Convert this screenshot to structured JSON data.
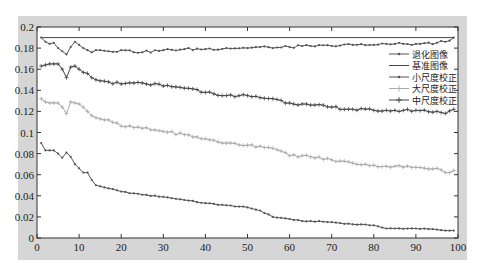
{
  "chart_data": {
    "type": "line",
    "title": "",
    "xlabel": "",
    "ylabel": "",
    "xlim": [
      0,
      100
    ],
    "ylim": [
      0,
      0.2
    ],
    "grid": false,
    "legend_position": "upper right (inside)",
    "x_ticks": [
      "0",
      "10",
      "20",
      "30",
      "40",
      "50",
      "60",
      "70",
      "80",
      "90",
      "100"
    ],
    "y_ticks": [
      "0",
      "0.02",
      "0.04",
      "0.06",
      "0.08",
      "0.1",
      "0.12",
      "0.14",
      "0.16",
      "0.18",
      "0.2"
    ],
    "x_anchor": [
      1,
      2,
      3,
      4,
      5,
      6,
      7,
      8,
      9,
      10,
      11,
      12,
      13,
      14,
      15,
      17,
      20,
      25,
      30,
      35,
      40,
      45,
      50,
      53,
      56,
      60,
      63,
      65,
      70,
      75,
      80,
      83,
      85,
      90,
      95,
      97,
      99
    ],
    "series": [
      {
        "name": "退化图像",
        "color": "#555555",
        "marker": "dot",
        "values": [
          0.09,
          0.083,
          0.083,
          0.083,
          0.08,
          0.076,
          0.081,
          0.077,
          0.07,
          0.066,
          0.062,
          0.062,
          0.055,
          0.05,
          0.049,
          0.047,
          0.044,
          0.041,
          0.039,
          0.036,
          0.033,
          0.031,
          0.029,
          0.026,
          0.02,
          0.018,
          0.016,
          0.016,
          0.015,
          0.013,
          0.012,
          0.009,
          0.009,
          0.009,
          0.008,
          0.007,
          0.007
        ]
      },
      {
        "name": "基准图像",
        "color": "#444444",
        "marker": "none",
        "values": [
          0.19,
          0.19,
          0.19,
          0.19,
          0.19,
          0.19,
          0.19,
          0.19,
          0.19,
          0.19,
          0.19,
          0.19,
          0.19,
          0.19,
          0.19,
          0.19,
          0.19,
          0.19,
          0.19,
          0.19,
          0.19,
          0.19,
          0.19,
          0.19,
          0.19,
          0.19,
          0.19,
          0.19,
          0.19,
          0.19,
          0.19,
          0.19,
          0.19,
          0.19,
          0.19,
          0.19,
          0.19
        ]
      },
      {
        "name": "小尺度校正",
        "color": "#555555",
        "marker": "dot",
        "values": [
          0.19,
          0.186,
          0.184,
          0.185,
          0.18,
          0.177,
          0.174,
          0.181,
          0.186,
          0.183,
          0.18,
          0.178,
          0.176,
          0.178,
          0.178,
          0.177,
          0.178,
          0.176,
          0.178,
          0.179,
          0.179,
          0.18,
          0.18,
          0.181,
          0.18,
          0.181,
          0.182,
          0.182,
          0.182,
          0.183,
          0.183,
          0.184,
          0.184,
          0.184,
          0.185,
          0.186,
          0.19
        ]
      },
      {
        "name": "大尺度校正",
        "color": "#aaaaaa",
        "marker": "plus",
        "values": [
          0.132,
          0.129,
          0.128,
          0.128,
          0.128,
          0.124,
          0.118,
          0.129,
          0.128,
          0.127,
          0.124,
          0.12,
          0.116,
          0.114,
          0.113,
          0.112,
          0.106,
          0.104,
          0.101,
          0.098,
          0.094,
          0.09,
          0.088,
          0.087,
          0.085,
          0.078,
          0.078,
          0.077,
          0.074,
          0.071,
          0.069,
          0.068,
          0.068,
          0.067,
          0.066,
          0.062,
          0.064
        ]
      },
      {
        "name": "中尺度校正",
        "color": "#444444",
        "marker": "plus",
        "values": [
          0.163,
          0.164,
          0.165,
          0.165,
          0.165,
          0.16,
          0.152,
          0.162,
          0.163,
          0.16,
          0.157,
          0.156,
          0.152,
          0.15,
          0.149,
          0.148,
          0.146,
          0.147,
          0.144,
          0.142,
          0.138,
          0.135,
          0.135,
          0.133,
          0.132,
          0.128,
          0.127,
          0.126,
          0.124,
          0.122,
          0.121,
          0.121,
          0.121,
          0.121,
          0.12,
          0.118,
          0.122
        ]
      }
    ]
  },
  "legend": {
    "items": [
      {
        "label": "退化图像"
      },
      {
        "label": "基准图像"
      },
      {
        "label": "小尺度校正"
      },
      {
        "label": "大尺度校正"
      },
      {
        "label": "中尺度校正"
      }
    ]
  },
  "colors": {
    "frame_background": "#d6d6d6",
    "plot_background": "#ffffff",
    "axis": "#333333"
  }
}
